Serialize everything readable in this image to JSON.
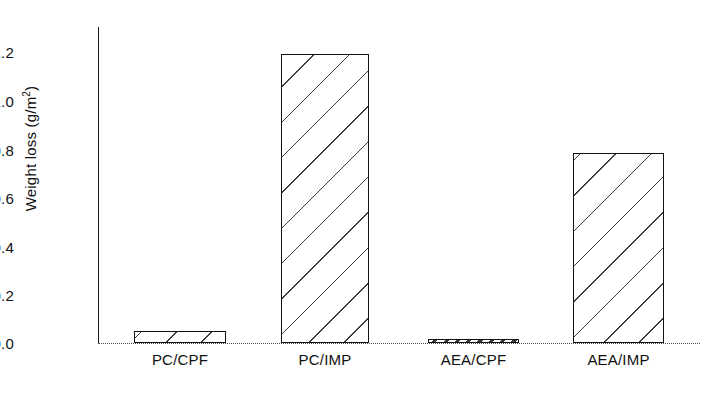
{
  "chart_data": {
    "type": "bar",
    "title": "",
    "xlabel": "",
    "ylabel": "Weight loss (g/m2)",
    "ylabel_base": "Weight loss (g/m",
    "ylabel_sup": "2",
    "ylabel_close": ")",
    "categories": [
      "PC/CPF",
      "PC/IMP",
      "AEA/CPF",
      "AEA/IMP"
    ],
    "values": [
      0.05,
      1.19,
      0.015,
      0.785
    ],
    "ylim": [
      0.0,
      1.3
    ],
    "ytick_values": [
      0.0,
      0.2,
      0.4,
      0.6,
      0.8,
      1.0,
      1.2
    ],
    "ytick_labels": [
      "0.0",
      "0.2",
      "0.4",
      "0.6",
      "0.8",
      "1.0",
      "1.2"
    ],
    "grid": false,
    "legend": "none",
    "bar_fill": "hatched-diagonal",
    "bar_edge_color": "#111111",
    "baseline_style": "dotted",
    "axis_color": "#1a1a1a"
  }
}
